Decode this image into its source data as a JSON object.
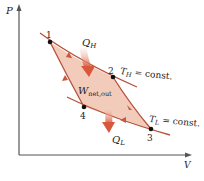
{
  "diagram": {
    "type": "P-V diagram of Carnot cycle",
    "axes": {
      "y_label": "P",
      "x_label": "V"
    },
    "points": [
      {
        "id": "1",
        "label": "1"
      },
      {
        "id": "2",
        "label": "2"
      },
      {
        "id": "3",
        "label": "3"
      },
      {
        "id": "4",
        "label": "4"
      }
    ],
    "isotherms": {
      "high": {
        "symbol": "T",
        "subscript": "H",
        "suffix": " = const."
      },
      "low": {
        "symbol": "T",
        "subscript": "L",
        "suffix": " = const."
      }
    },
    "heat_in": {
      "symbol": "Q",
      "subscript": "H"
    },
    "heat_out": {
      "symbol": "Q",
      "subscript": "L"
    },
    "work": {
      "symbol": "W",
      "subscript": "net,out"
    },
    "colors": {
      "region_fill": "#f2cbbb",
      "curve": "#b5523b",
      "arrow": "#d9573a",
      "axis": "#555555"
    }
  }
}
